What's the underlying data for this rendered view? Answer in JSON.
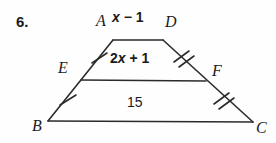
{
  "problem": {
    "number": "6."
  },
  "figure": {
    "type": "trapezoid-with-midsegment",
    "vertices": {
      "a": "A",
      "b": "B",
      "c": "C",
      "d": "D",
      "e": "E",
      "f": "F"
    },
    "labels": {
      "top_side": "x − 1",
      "top_side_coefficient": "",
      "top_side_variable": "x",
      "top_side_operator": "−",
      "top_side_constant": "1",
      "midsegment": "2x + 1",
      "midsegment_coefficient": "2",
      "midsegment_variable": "x",
      "midsegment_operator": "+",
      "midsegment_constant": "1",
      "bottom_side": "15"
    },
    "tick_marks": {
      "ae": "single",
      "eb": "single",
      "df": "double",
      "fc": "double"
    },
    "stroke_color": "#2b2b2b",
    "text_color": "#1b1b1b"
  }
}
